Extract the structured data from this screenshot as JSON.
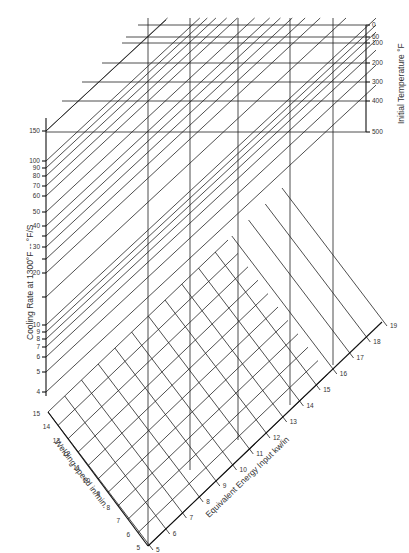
{
  "chart_data": {
    "type": "nomograph",
    "title": "",
    "axes": {
      "cooling_rate": {
        "label": "Cooling Rate at 1300°F  --  °F/S",
        "scale": "log",
        "ticks": [
          150,
          100,
          90,
          80,
          70,
          60,
          50,
          40,
          30,
          20,
          10,
          9,
          8,
          7,
          6,
          5,
          4
        ],
        "tick_labels": [
          "150",
          "100",
          "90",
          "80",
          "70",
          "60",
          "50",
          "40",
          "",
          "30",
          "",
          "20",
          "",
          "10",
          "9",
          "8",
          "7",
          "6",
          "5",
          "4"
        ],
        "labeled_ticks": [
          "150",
          "100",
          "90",
          "80",
          "70",
          "60",
          "50",
          "40",
          "30",
          "20",
          "10",
          "9",
          "8",
          "7",
          "6",
          "5",
          "4"
        ]
      },
      "initial_temperature": {
        "label": "Initial Temperature °F",
        "ticks": [
          0,
          60,
          100,
          200,
          300,
          400,
          500
        ],
        "tick_labels": [
          "0",
          "60",
          "100",
          "200",
          "300",
          "400",
          "500"
        ]
      },
      "welding_speed": {
        "label": "Welding speed  in/min.",
        "ticks": [
          15,
          14,
          13,
          12,
          11,
          10,
          9,
          8,
          7,
          6,
          5
        ],
        "tick_labels": [
          "15",
          "14",
          "13",
          "12",
          "11",
          "10",
          "9",
          "8",
          "7",
          "6",
          "5"
        ]
      },
      "energy_input": {
        "label": "Equivalent Energy Input  kw/in",
        "ticks": [
          5,
          6,
          7,
          8,
          9,
          10,
          11,
          12,
          13,
          14,
          15,
          16,
          17,
          18,
          19
        ],
        "tick_labels": [
          "5",
          "6",
          "7",
          "8",
          "9",
          "10",
          "11",
          "12",
          "13",
          "14",
          "15",
          "16",
          "17",
          "18",
          "19"
        ]
      }
    },
    "grid": true,
    "legend": "none"
  },
  "labels": {
    "cooling_rate": "Cooling Rate at 1300°F  --  °F/S",
    "initial_temperature": "Initial Temperature °F",
    "welding_speed": "Welding speed  in/min.",
    "energy_input": "Equivalent Energy Input  kw/in"
  }
}
